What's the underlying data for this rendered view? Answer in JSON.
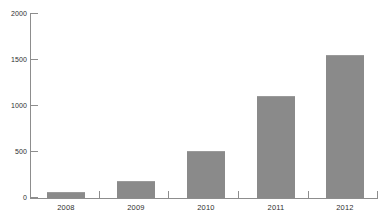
{
  "chart_data": {
    "type": "bar",
    "title": "",
    "subtitle": "",
    "xlabel": "",
    "ylabel": "",
    "categories": [
      "2008",
      "2009",
      "2010",
      "2011",
      "2012"
    ],
    "values": [
      65,
      185,
      510,
      1100,
      1545
    ],
    "series": [
      {
        "name": "",
        "values": [
          65,
          185,
          510,
          1100,
          1545
        ]
      }
    ],
    "ylim": [
      0,
      2000
    ],
    "yticks": [
      0,
      500,
      1000,
      1500,
      2000
    ],
    "ytick_labels": [
      "0",
      "500",
      "1000",
      "1500",
      "2000"
    ],
    "grid": false,
    "legend": false,
    "legend_position": "none",
    "annotations": [],
    "bar_color": "#8a8a8a",
    "axis_color": "#8d8d8d",
    "background_color": "#ffffff",
    "text_color": "#2e2e2e"
  },
  "axis": {
    "y_labels": [
      "2000",
      "1500",
      "1000",
      "500",
      "0"
    ],
    "x_labels": [
      "2008",
      "2009",
      "2010",
      "2011",
      "2012"
    ]
  }
}
